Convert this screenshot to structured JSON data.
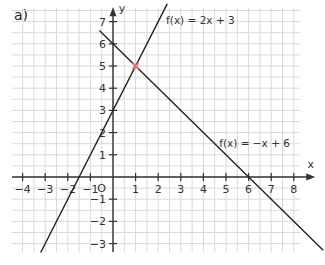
{
  "part_label": "a)",
  "chart_data": {
    "type": "line",
    "title": "",
    "xlabel": "x",
    "ylabel": "y",
    "xlim": [
      -4.5,
      8.9
    ],
    "ylim": [
      -3.3,
      7.7
    ],
    "grid": true,
    "grid_step": 0.5,
    "x_ticks": [
      -4,
      -3,
      -2,
      -1,
      1,
      2,
      3,
      4,
      5,
      6,
      7,
      8
    ],
    "y_ticks": [
      -3,
      -2,
      -1,
      1,
      2,
      3,
      4,
      5,
      6,
      7
    ],
    "origin_label": "O",
    "series": [
      {
        "name": "f(x) = 2x + 3",
        "slope": 2,
        "intercept": 3,
        "x_range": [
          -3.2,
          2.4
        ],
        "label_pos": [
          2.35,
          6.9
        ]
      },
      {
        "name": "f(x) = −x + 6",
        "slope": -1,
        "intercept": 6,
        "x_range": [
          -0.6,
          9.3
        ],
        "label_pos": [
          4.7,
          1.35
        ]
      }
    ],
    "annotations": [
      {
        "type": "point",
        "x": 1,
        "y": 5,
        "label": "intersection",
        "color": "#e8707a"
      }
    ]
  },
  "colors": {
    "grid": "#d9d9d9",
    "axis": "#333333",
    "line": "#222222",
    "marker": "#e8707a"
  }
}
